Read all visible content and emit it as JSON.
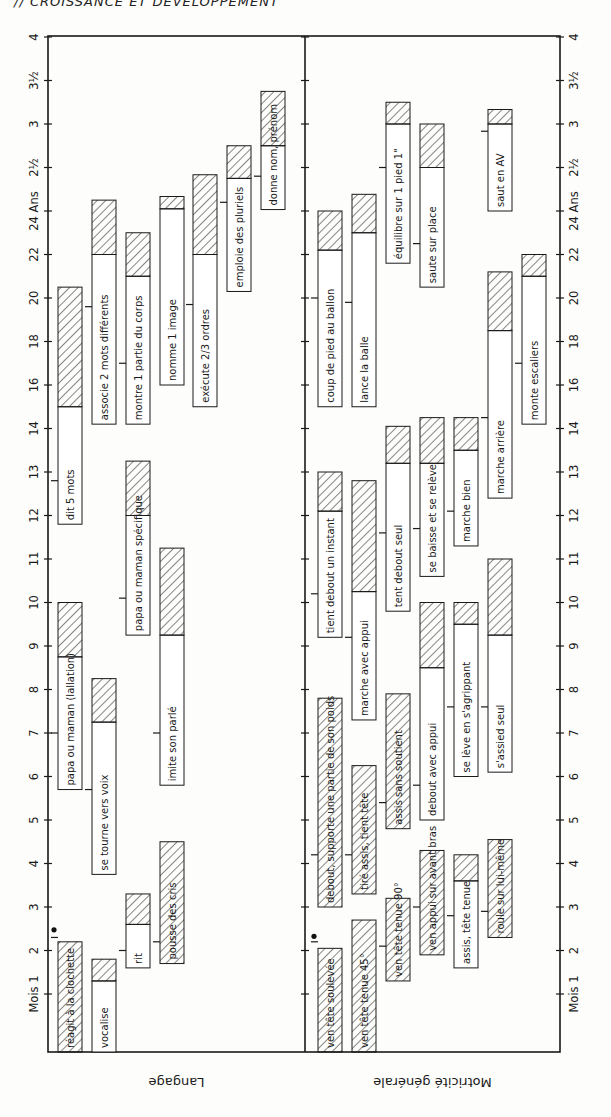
{
  "header": "// CROISSANCE ET DÉVELOPPEMENT",
  "chart_data": {
    "type": "gantt-range-bar",
    "orientation": "rotated: age axis runs bottom-to-top, text rotated 90°",
    "title": "",
    "xlabel": "Âge (Mois → Ans)",
    "age_axis_ticks": [
      "Mois 1",
      "2",
      "3",
      "4",
      "5",
      "6",
      "7",
      "8",
      "9",
      "10",
      "11",
      "12",
      "13",
      "14",
      "16",
      "18",
      "20",
      "22",
      "24 Ans 2 ½",
      "3",
      "3½",
      "4"
    ],
    "age_tick_values_months": [
      1,
      2,
      3,
      4,
      5,
      6,
      7,
      8,
      9,
      10,
      11,
      12,
      13,
      14,
      16,
      18,
      20,
      22,
      24,
      30,
      36,
      42,
      48
    ],
    "legend": {
      "plain": "âge d'apparition (début de la plage)",
      "hatched": "fin de la plage d'acquisition"
    },
    "panels": [
      {
        "name": "Langage",
        "items": [
          {
            "label": "réagit à la clochette",
            "start": 0,
            "hatch_start": 0,
            "end": 2.2,
            "median": 2.3,
            "col": 0,
            "dot": true
          },
          {
            "label": "vocalise",
            "start": 0,
            "hatch_start": 1.3,
            "end": 1.8,
            "median": null,
            "col": 1
          },
          {
            "label": "rit",
            "start": 1.6,
            "hatch_start": 2.6,
            "end": 3.3,
            "median": 2,
            "col": 2
          },
          {
            "label": "pousse des cris",
            "start": 1.7,
            "hatch_start": 1.7,
            "end": 4.5,
            "median": 2.2,
            "col": 3
          },
          {
            "label": "se tourne vers voix",
            "start": 3.75,
            "hatch_start": 7.25,
            "end": 8.25,
            "median": 5.7,
            "col": 1
          },
          {
            "label": "papa ou maman (lallation)",
            "start": 5.7,
            "hatch_start": 8.75,
            "end": 10,
            "median": 7,
            "col": 0
          },
          {
            "label": "imite son parlé",
            "start": 5.8,
            "hatch_start": 9.25,
            "end": 11.25,
            "median": 7,
            "col": 3
          },
          {
            "label": "papa ou maman spécifique",
            "start": 9.25,
            "hatch_start": 12,
            "end": 13.25,
            "median": 10.1,
            "col": 2
          },
          {
            "label": "dit 5 mots",
            "start": 11.8,
            "hatch_start": 15,
            "end": 20.5,
            "median": 12.8,
            "col": 0
          },
          {
            "label": "associe 2 mots différents",
            "start": 14.2,
            "hatch_start": 22,
            "end": 25.5,
            "median": 19.6,
            "col": 1
          },
          {
            "label": "montre 1 partie du corps",
            "start": 14.2,
            "hatch_start": 21,
            "end": 23,
            "median": 17,
            "col": 2
          },
          {
            "label": "nomme 1 image",
            "start": 16,
            "hatch_start": 24.3,
            "end": 26,
            "median": null,
            "col": 3
          },
          {
            "label": "exécute 2/3 ordres",
            "start": 15,
            "hatch_start": 22,
            "end": 29,
            "median": 19.7,
            "col": 4
          },
          {
            "label": "emploie des pluriels",
            "start": 20.3,
            "hatch_start": 28.5,
            "end": 33,
            "median": 25.2,
            "col": 5
          },
          {
            "label": "donne nom, prénom",
            "start": 24.2,
            "hatch_start": 33,
            "end": 40.5,
            "median": 28.8,
            "col": 6
          }
        ]
      },
      {
        "name": "Motricité générale",
        "items": [
          {
            "label": "ven tête soulevée",
            "start": 0,
            "hatch_start": 0,
            "end": 2.05,
            "median": 2.2,
            "col": 0,
            "dot": true
          },
          {
            "label": "ven tête tenue 45°",
            "start": 0,
            "hatch_start": 0,
            "end": 2.7,
            "median": null,
            "col": 1
          },
          {
            "label": "ven tête tenue 90°",
            "start": 1.3,
            "hatch_start": 1.3,
            "end": 3.2,
            "median": 2.1,
            "col": 2
          },
          {
            "label": "ven appui sur avant bras",
            "start": 1.9,
            "hatch_start": 1.9,
            "end": 4.3,
            "median": 3,
            "col": 3
          },
          {
            "label": "assis, tête tenue",
            "start": 1.6,
            "hatch_start": 3.6,
            "end": 4.2,
            "median": 2.8,
            "col": 4
          },
          {
            "label": "roule sur lui-même",
            "start": 2.3,
            "hatch_start": 2.3,
            "end": 4.55,
            "median": 2.9,
            "col": 5
          },
          {
            "label": "debout, supporte une partie de son poids",
            "start": 3,
            "hatch_start": 3,
            "end": 7.8,
            "median": 4.2,
            "col": 0
          },
          {
            "label": "tiré assis, tient tête",
            "start": 3.3,
            "hatch_start": 3.3,
            "end": 6.25,
            "median": 4.2,
            "col": 1
          },
          {
            "label": "assis sans soutient",
            "start": 4.8,
            "hatch_start": 4.8,
            "end": 7.9,
            "median": 5.4,
            "col": 2
          },
          {
            "label": "debout avec appui",
            "start": 5,
            "hatch_start": 8.5,
            "end": 10,
            "median": 5.8,
            "col": 3
          },
          {
            "label": "se lève en s'agrippant",
            "start": 6,
            "hatch_start": 9.5,
            "end": 10,
            "median": 7.6,
            "col": 4
          },
          {
            "label": "s'assied seul",
            "start": 6.1,
            "hatch_start": 9.25,
            "end": 11,
            "median": 7.6,
            "col": 5
          },
          {
            "label": "tient debout un instant",
            "start": 9.2,
            "hatch_start": 12.1,
            "end": 13,
            "median": 10.2,
            "col": 0
          },
          {
            "label": "marche avec appui",
            "start": 7.3,
            "hatch_start": 10.25,
            "end": 12.8,
            "median": 9.2,
            "col": 1
          },
          {
            "label": "tent debout seul",
            "start": 9.8,
            "hatch_start": 13.2,
            "end": 14.1,
            "median": 11.6,
            "col": 2
          },
          {
            "label": "se baisse et se relève",
            "start": 10.6,
            "hatch_start": 13.2,
            "end": 14.5,
            "median": 11.7,
            "col": 3
          },
          {
            "label": "marche bien",
            "start": 11.3,
            "hatch_start": 13.5,
            "end": 14.5,
            "median": 12.1,
            "col": 4
          },
          {
            "label": "marche arrière",
            "start": 12.4,
            "hatch_start": 18.5,
            "end": 21.2,
            "median": 14.5,
            "col": 5
          },
          {
            "label": "coup de pied au ballon",
            "start": 15,
            "hatch_start": 22.2,
            "end": 24,
            "median": 20,
            "col": 0
          },
          {
            "label": "lance la balle",
            "start": 15,
            "hatch_start": 23,
            "end": 26.3,
            "median": 19.8,
            "col": 1
          },
          {
            "label": "équilibre sur 1 pied 1\"",
            "start": 21.6,
            "hatch_start": 36,
            "end": 39,
            "median": 30,
            "col": 2
          },
          {
            "label": "saute sur place",
            "start": 20.5,
            "hatch_start": 30,
            "end": 36,
            "median": 22.5,
            "col": 3
          },
          {
            "label": "monte escaliers",
            "start": 14.2,
            "hatch_start": 21,
            "end": 22,
            "median": 17,
            "col": 6
          },
          {
            "label": "saut en AV",
            "start": 24,
            "hatch_start": 36,
            "end": 38,
            "median": 35,
            "col": 5
          }
        ]
      }
    ]
  }
}
